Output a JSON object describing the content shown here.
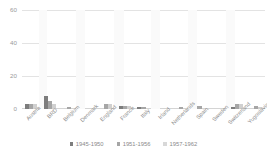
{
  "chart_data": {
    "type": "bar",
    "title": "",
    "xlabel": "",
    "ylabel": "",
    "ylim": [
      0,
      60
    ],
    "yticks": [
      0,
      20,
      40,
      60
    ],
    "grid": true,
    "legend_position": "bottom",
    "categories": [
      "Austria",
      "BRD",
      "Belgium",
      "Denmark",
      "England",
      "France",
      "Italy",
      "Irland",
      "Netherlands",
      "Spain",
      "Sweden",
      "Switzerland",
      "Yugoslavia"
    ],
    "series": [
      {
        "name": "1945-1950",
        "color": "#7d7d7d",
        "values": [
          3,
          8,
          0,
          0,
          0,
          2,
          1,
          0,
          0,
          0,
          0,
          1,
          0
        ]
      },
      {
        "name": "1951-1956",
        "color": "#a6a6a6",
        "values": [
          3,
          5,
          1,
          0,
          3,
          2,
          1,
          0,
          1,
          2,
          0,
          3,
          2
        ]
      },
      {
        "name": "1957-1962",
        "color": "#d0d0d0",
        "values": [
          3,
          3,
          0,
          0,
          3,
          2,
          0,
          0,
          0,
          0,
          0,
          3,
          1
        ]
      }
    ]
  },
  "axis": {
    "y_tick_labels": [
      "60",
      "40",
      "20",
      "0"
    ]
  },
  "legend": {
    "items": [
      {
        "label": "1945-1950"
      },
      {
        "label": "1951-1956"
      },
      {
        "label": "1957-1962"
      }
    ]
  },
  "colors": {
    "series_1": "#7d7d7d",
    "series_2": "#a6a6a6",
    "series_3": "#d0d0d0",
    "gridline": "#e3e3e3",
    "text": "#8a8a8a",
    "background": "#ffffff"
  }
}
